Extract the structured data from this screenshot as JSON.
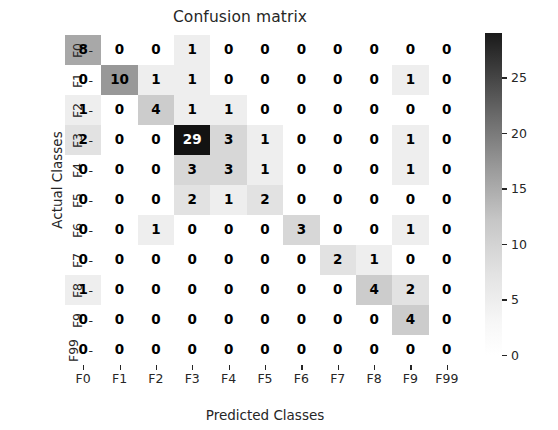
{
  "chart_data": {
    "type": "heatmap",
    "title": "Confusion matrix",
    "xlabel": "Predicted Classes",
    "ylabel": "Actual Classes",
    "x_categories": [
      "F0",
      "F1",
      "F2",
      "F3",
      "F4",
      "F5",
      "F6",
      "F7",
      "F8",
      "F9",
      "F99"
    ],
    "y_categories": [
      "F0",
      "F1",
      "F2",
      "F3",
      "F4",
      "F5",
      "F6",
      "F7",
      "F8",
      "F9",
      "F99"
    ],
    "colormap": "greys",
    "vmin": 0,
    "vmax": 29,
    "grid": false,
    "legend_position": "right",
    "colorbar": {
      "ticks": [
        0,
        5,
        10,
        15,
        20,
        25
      ],
      "tick_labels": [
        "0",
        "5",
        "10",
        "15",
        "20",
        "25"
      ],
      "min_color": "#ffffff",
      "max_color": "#1a1a1a"
    },
    "values": [
      [
        8,
        0,
        0,
        1,
        0,
        0,
        0,
        0,
        0,
        0,
        0
      ],
      [
        0,
        10,
        1,
        1,
        0,
        0,
        0,
        0,
        0,
        1,
        0
      ],
      [
        1,
        0,
        4,
        1,
        1,
        0,
        0,
        0,
        0,
        0,
        0
      ],
      [
        2,
        0,
        0,
        29,
        3,
        1,
        0,
        0,
        0,
        1,
        0
      ],
      [
        0,
        0,
        0,
        3,
        3,
        1,
        0,
        0,
        0,
        1,
        0
      ],
      [
        0,
        0,
        0,
        2,
        1,
        2,
        0,
        0,
        0,
        0,
        0
      ],
      [
        0,
        0,
        1,
        0,
        0,
        0,
        3,
        0,
        0,
        1,
        0
      ],
      [
        0,
        0,
        0,
        0,
        0,
        0,
        0,
        2,
        1,
        0,
        0
      ],
      [
        1,
        0,
        0,
        0,
        0,
        0,
        0,
        0,
        4,
        2,
        0
      ],
      [
        0,
        0,
        0,
        0,
        0,
        0,
        0,
        0,
        0,
        4,
        0
      ],
      [
        0,
        0,
        0,
        0,
        0,
        0,
        0,
        0,
        0,
        0,
        0
      ]
    ]
  }
}
